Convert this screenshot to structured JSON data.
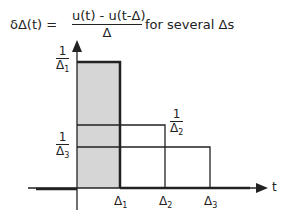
{
  "equation": {
    "lhs": "δΔ(t) =",
    "numerator": "u(t) - u(t-Δ)",
    "denominator": "Δ",
    "rhs": "for several Δs"
  },
  "axis": {
    "x_label": "t"
  },
  "heights": [
    {
      "numerator": "1",
      "denominator": "Δ",
      "sub": "1"
    },
    {
      "numerator": "1",
      "denominator": "Δ",
      "sub": "2"
    },
    {
      "numerator": "1",
      "denominator": "Δ",
      "sub": "3"
    }
  ],
  "ticks": [
    {
      "label": "Δ",
      "sub": "1"
    },
    {
      "label": "Δ",
      "sub": "2"
    },
    {
      "label": "Δ",
      "sub": "3"
    }
  ],
  "colors": {
    "fill": "#d6d6d6",
    "line": "#222222"
  }
}
